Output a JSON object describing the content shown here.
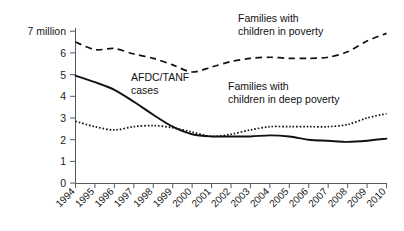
{
  "chart_data": {
    "type": "line",
    "title": "",
    "subtitle": "",
    "xlabel": "",
    "ylabel": "",
    "ylim": [
      0,
      7
    ],
    "xlim": [
      1994,
      2010
    ],
    "grid": false,
    "legend_position": "inline-annotations",
    "y_ticks": [
      "0",
      "1",
      "2",
      "3",
      "4",
      "5",
      "6",
      "7 million"
    ],
    "y_tick_values": [
      0,
      1,
      2,
      3,
      4,
      5,
      6,
      7
    ],
    "y_top_label": "7 million",
    "categories": [
      1994,
      1995,
      1996,
      1997,
      1998,
      1999,
      2000,
      2001,
      2002,
      2003,
      2004,
      2005,
      2006,
      2007,
      2008,
      2009,
      2010
    ],
    "x_tick_labels": [
      "1994",
      "1995",
      "1996",
      "1997",
      "1998",
      "1999",
      "2000",
      "2001",
      "2002",
      "2003",
      "2004",
      "2005",
      "2006",
      "2007",
      "2008",
      "2009",
      "2010"
    ],
    "series": [
      {
        "name": "Families with children in poverty",
        "style": "dashed",
        "color": "#111111",
        "values": [
          6.5,
          6.15,
          6.2,
          5.95,
          5.75,
          5.45,
          5.12,
          5.35,
          5.6,
          5.75,
          5.8,
          5.75,
          5.75,
          5.8,
          6.05,
          6.55,
          6.9
        ]
      },
      {
        "name": "AFDC/TANF cases",
        "style": "solid",
        "color": "#111111",
        "values": [
          4.95,
          4.65,
          4.3,
          3.75,
          3.15,
          2.6,
          2.25,
          2.15,
          2.15,
          2.15,
          2.2,
          2.15,
          2.0,
          1.95,
          1.9,
          1.95,
          2.05
        ]
      },
      {
        "name": "Families with children in deep poverty",
        "style": "dotted",
        "color": "#111111",
        "values": [
          2.85,
          2.6,
          2.45,
          2.6,
          2.65,
          2.55,
          2.35,
          2.15,
          2.25,
          2.45,
          2.6,
          2.6,
          2.6,
          2.6,
          2.7,
          3.0,
          3.2
        ]
      }
    ],
    "annotations": [
      {
        "name": "families-in-poverty",
        "lines": [
          "Families with",
          "children in poverty"
        ],
        "x": 238,
        "y": 20
      },
      {
        "name": "afdc-tanf-cases",
        "lines": [
          "AFDC/TANF",
          "cases"
        ],
        "x": 130,
        "y": 78
      },
      {
        "name": "families-in-deep-poverty",
        "lines": [
          "Families with",
          "children in deep poverty"
        ],
        "x": 228,
        "y": 88
      }
    ]
  },
  "labels": {
    "y_top": "7 million",
    "y6": "6",
    "y5": "5",
    "y4": "4",
    "y3": "3",
    "y2": "2",
    "y1": "1",
    "y0": "0",
    "x1994": "1994",
    "x1995": "1995",
    "x1996": "1996",
    "x1997": "1997",
    "x1998": "1998",
    "x1999": "1999",
    "x2000": "2000",
    "x2001": "2001",
    "x2002": "2002",
    "x2003": "2003",
    "x2004": "2004",
    "x2005": "2005",
    "x2006": "2006",
    "x2007": "2007",
    "x2008": "2008",
    "x2009": "2009",
    "x2010": "2010",
    "ann_poverty_l1": "Families with",
    "ann_poverty_l2": "children in poverty",
    "ann_afdc_l1": "AFDC/TANF",
    "ann_afdc_l2": "cases",
    "ann_deep_l1": "Families with",
    "ann_deep_l2": "children in deep poverty"
  }
}
